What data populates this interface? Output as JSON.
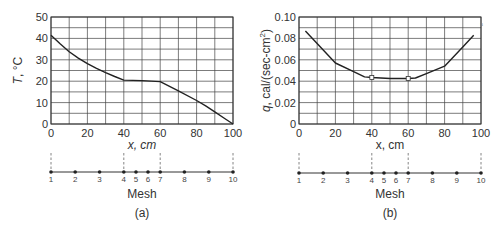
{
  "chart_data": [
    {
      "id": "a",
      "type": "line",
      "caption": "(a)",
      "title": "",
      "xlabel": "x, cm",
      "ylabel": "T, °C",
      "xlim": [
        0,
        100
      ],
      "ylim": [
        0,
        50
      ],
      "xticks": [
        0,
        20,
        40,
        60,
        80,
        100
      ],
      "yticks": [
        0,
        10,
        20,
        30,
        40,
        50
      ],
      "grid": true,
      "grid_x_step": 10,
      "grid_y_step": 5,
      "series": [
        {
          "name": "Temperature",
          "x": [
            0,
            5,
            10,
            15,
            20,
            25,
            30,
            35,
            40,
            50,
            60,
            70,
            80,
            85,
            90,
            95,
            100
          ],
          "y": [
            41.5,
            37.5,
            33.8,
            30.8,
            28.2,
            26,
            24,
            22.2,
            20.5,
            20.3,
            19.8,
            15.5,
            11,
            8.5,
            5.7,
            2.8,
            0
          ]
        }
      ],
      "markers": [],
      "mesh": {
        "label": "Mesh",
        "nodes": [
          {
            "n": "1",
            "x": 0
          },
          {
            "n": "2",
            "x": 13.3
          },
          {
            "n": "3",
            "x": 26.7
          },
          {
            "n": "4",
            "x": 40
          },
          {
            "n": "5",
            "x": 46.7
          },
          {
            "n": "6",
            "x": 53.3
          },
          {
            "n": "7",
            "x": 60
          },
          {
            "n": "8",
            "x": 73.3
          },
          {
            "n": "9",
            "x": 86.7
          },
          {
            "n": "10",
            "x": 100
          }
        ],
        "dashed_at": [
          0,
          40,
          60,
          100
        ]
      }
    },
    {
      "id": "b",
      "type": "line",
      "caption": "(b)",
      "title": "",
      "xlabel": "x, cm",
      "ylabel": "q, cal/(sec-cm²)",
      "xlim": [
        0,
        100
      ],
      "ylim": [
        0,
        0.1
      ],
      "xticks": [
        0,
        20,
        40,
        60,
        80,
        100
      ],
      "yticks": [
        "0",
        "0.02",
        "0.04",
        "0.06",
        "0.08",
        "0.10"
      ],
      "ytick_values": [
        0,
        0.02,
        0.04,
        0.06,
        0.08,
        0.1
      ],
      "grid": true,
      "grid_x_step": 10,
      "grid_y_step": 0.01,
      "series": [
        {
          "name": "Heat flux",
          "x": [
            3.5,
            20,
            30,
            36,
            40,
            50,
            60,
            64,
            70,
            80,
            90,
            96
          ],
          "y": [
            0.087,
            0.057,
            0.049,
            0.044,
            0.0435,
            0.0425,
            0.0425,
            0.043,
            0.047,
            0.054,
            0.072,
            0.083
          ]
        }
      ],
      "markers": [
        {
          "x": 40,
          "y": 0.0435
        },
        {
          "x": 60,
          "y": 0.0425
        }
      ],
      "mesh": {
        "label": "Mesh",
        "nodes": [
          {
            "n": "1",
            "x": 0
          },
          {
            "n": "2",
            "x": 13.3
          },
          {
            "n": "3",
            "x": 26.7
          },
          {
            "n": "4",
            "x": 40
          },
          {
            "n": "5",
            "x": 46.7
          },
          {
            "n": "6",
            "x": 53.3
          },
          {
            "n": "7",
            "x": 60
          },
          {
            "n": "8",
            "x": 73.3
          },
          {
            "n": "9",
            "x": 86.7
          },
          {
            "n": "10",
            "x": 100
          }
        ],
        "dashed_at": [
          0,
          40,
          60,
          100
        ]
      }
    }
  ],
  "panels": {
    "a": {
      "caption": "(a)",
      "xlabel": "x, cm",
      "mesh_label": "Mesh",
      "ylabel_italic": "T",
      "ylabel_rest": ", °C"
    },
    "b": {
      "caption": "(b)",
      "xlabel": "x, cm",
      "mesh_label": "Mesh",
      "ylabel_italic": "q",
      "ylabel_rest": ", cal/(sec-cm",
      "ylabel_sup": "2",
      "ylabel_close": ")"
    }
  }
}
